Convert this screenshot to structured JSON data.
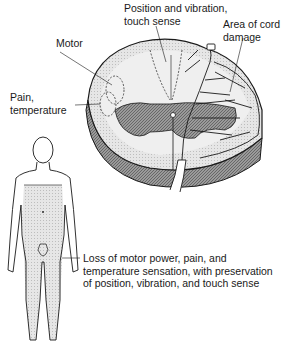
{
  "labels": {
    "position": "Position and vibration,\ntouch sense",
    "motor": "Motor",
    "pain": "Pain,\ntemperature",
    "damage": "Area of cord\ndamage",
    "caption": "Loss of motor power, pain, and\ntemperature sensation, with preservation\nof position, vibration, and touch sense"
  },
  "colors": {
    "outline": "#1a1a1a",
    "gray_matter": "#8a8a8a",
    "white_matter": "#e4e4e4",
    "rim": "#777777",
    "body_shade": "#e0e0e0",
    "background": "#ffffff"
  }
}
